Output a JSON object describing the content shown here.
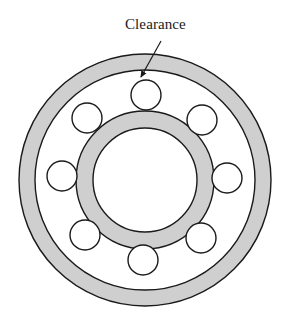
{
  "diagram": {
    "type": "ball-bearing-cross-section",
    "label": "Clearance",
    "colors": {
      "ring_fill": "#cfcfcf",
      "stroke": "#1a1a1a",
      "background": "#ffffff"
    },
    "center": [
      145,
      180
    ],
    "outer_race": {
      "outer_radius": 126,
      "inner_radius": 110
    },
    "inner_race": {
      "outer_radius": 69,
      "inner_radius": 52
    },
    "balls": {
      "count": 8,
      "radius": 15,
      "positions": [
        [
          146,
          95
        ],
        [
          202,
          120
        ],
        [
          227,
          178
        ],
        [
          201,
          238
        ],
        [
          143,
          260
        ],
        [
          85,
          235
        ],
        [
          62,
          176
        ],
        [
          87,
          118
        ]
      ]
    },
    "arrow": {
      "from": [
        161,
        41
      ],
      "to": [
        141,
        77
      ]
    }
  }
}
